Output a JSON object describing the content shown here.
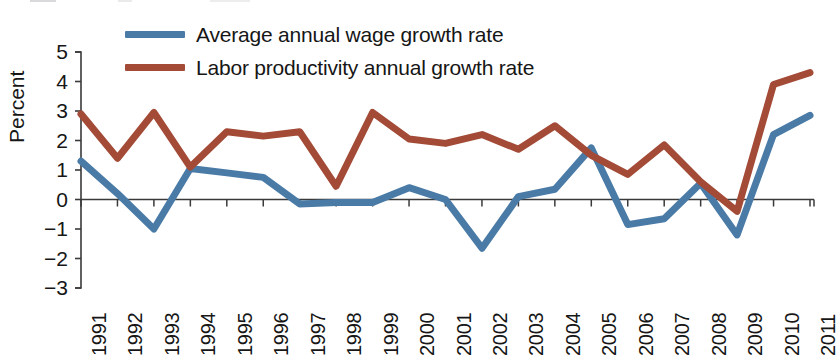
{
  "chart_data": {
    "type": "line",
    "title": "",
    "subtitle": "",
    "xlabel": "",
    "ylabel": "Percent",
    "ylim": [
      -3,
      5
    ],
    "yticks": [
      5,
      4,
      3,
      2,
      1,
      0,
      -1,
      -2,
      -3
    ],
    "ytick_labels": [
      "5",
      "4",
      "3",
      "2",
      "1",
      "0",
      "−1",
      "−2",
      "−3"
    ],
    "grid": false,
    "legend_position": "top-left",
    "zero_line": true,
    "categories": [
      "1991",
      "1992",
      "1993",
      "1994",
      "1995",
      "1996",
      "1997",
      "1998",
      "1999",
      "2000",
      "2001",
      "2002",
      "2003",
      "2004",
      "2005",
      "2006",
      "2007",
      "2008",
      "2009",
      "2010",
      "2011"
    ],
    "x": [
      1991,
      1992,
      1993,
      1994,
      1995,
      1996,
      1997,
      1998,
      1999,
      2000,
      2001,
      2002,
      2003,
      2004,
      2005,
      2006,
      2007,
      2008,
      2009,
      2010,
      2011
    ],
    "series": [
      {
        "name": "Average annual wage growth rate",
        "color": "#4a7ba7",
        "values": [
          1.3,
          0.2,
          -1.0,
          1.05,
          0.9,
          0.75,
          -0.15,
          -0.1,
          -0.1,
          0.4,
          0.0,
          -1.65,
          0.1,
          0.35,
          1.75,
          -0.85,
          -0.65,
          0.55,
          -1.2,
          2.2,
          2.85
        ]
      },
      {
        "name": "Labor productivity annual growth rate",
        "color": "#a34b37",
        "values": [
          2.9,
          1.4,
          2.95,
          1.1,
          2.3,
          2.15,
          2.3,
          0.45,
          2.95,
          2.05,
          1.9,
          2.2,
          1.7,
          2.5,
          1.5,
          0.85,
          1.85,
          0.6,
          -0.4,
          3.9,
          4.3
        ]
      }
    ]
  },
  "legend": {
    "items": [
      {
        "label": "Average annual wage growth rate",
        "color": "#4a7ba7"
      },
      {
        "label": "Labor productivity annual growth rate",
        "color": "#a34b37"
      }
    ]
  },
  "axes": {
    "y_axis_title": "Percent"
  }
}
